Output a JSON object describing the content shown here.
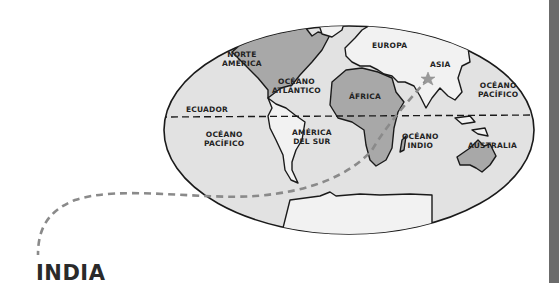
{
  "title": "INDIA",
  "colors": {
    "ocean": "#e2e2e2",
    "land_light": "#f2f2f2",
    "land_highlight": "#a8a8a8",
    "outline": "#1a1a1a",
    "route": "#8a8a8a",
    "star": "#9a9a9a",
    "side_bar": "#6b6b6b"
  },
  "map": {
    "projection": "oval world map",
    "equator_label": "ECUADOR",
    "continents": [
      {
        "name": "NORTE AMÉRICA",
        "label": "NORTE\nAMÉRICA",
        "highlighted": true
      },
      {
        "name": "AMÉRICA DEL SUR",
        "label": "AMÉRICA\nDEL SUR",
        "highlighted": false
      },
      {
        "name": "EUROPA",
        "label": "EUROPA",
        "highlighted": false
      },
      {
        "name": "ÁFRICA",
        "label": "ÁFRICA",
        "highlighted": true
      },
      {
        "name": "ASIA",
        "label": "ASIA",
        "highlighted": false
      },
      {
        "name": "AUSTRALIA",
        "label": "AUSTRALIA",
        "highlighted": true
      }
    ],
    "oceans": [
      {
        "name": "OCÉANO ATLÁNTICO",
        "label": "OCÉANO\nATLÁNTICO"
      },
      {
        "name": "OCÉANO PACÍFICO (west)",
        "label": "OCÉANO\nPACÍFICO"
      },
      {
        "name": "OCÉANO PACÍFICO (east)",
        "label": "OCÉANO\nPACÍFICO"
      },
      {
        "name": "OCÉANO ÍNDICO",
        "label": "OCÉANO\nINDIO"
      }
    ],
    "marker": {
      "type": "star",
      "location": "India"
    },
    "route": {
      "style": "dashed",
      "from": "India",
      "to": "INDIA title"
    }
  }
}
